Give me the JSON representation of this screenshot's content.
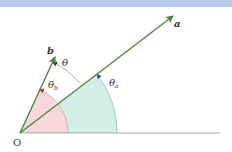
{
  "diagram": {
    "title": "",
    "header_band_color": "#b9c9e6",
    "origin": {
      "label": "O",
      "x": 20,
      "y": 133
    },
    "baseline": {
      "x1": 20,
      "y1": 133,
      "x2": 220,
      "y2": 133,
      "color": "#aaaaaa"
    },
    "vectors": [
      {
        "name": "a",
        "label": "a",
        "x2": 173,
        "y2": 16,
        "color": "#4a8a3a"
      },
      {
        "name": "b",
        "label": "b",
        "x2": 55,
        "y2": 57,
        "color": "#4a8a3a"
      }
    ],
    "angles": [
      {
        "name": "theta",
        "label": "θ",
        "sub": "",
        "between": [
          "a",
          "b"
        ],
        "arrow_color": "#222222"
      },
      {
        "name": "theta_b",
        "label": "θ",
        "sub": "b",
        "between": [
          "x-axis",
          "b"
        ],
        "fill": "#f6d8dc",
        "arrow_color": "#d03020"
      },
      {
        "name": "theta_a",
        "label": "θ",
        "sub": "a",
        "between": [
          "x-axis",
          "a"
        ],
        "fill": "#d3eee6",
        "arrow_color": "#2050a0"
      }
    ],
    "labels": {
      "a": "a",
      "b": "b",
      "theta": "θ",
      "theta_b": "θ",
      "theta_b_sub": "b",
      "theta_a": "θ",
      "theta_a_sub": "a",
      "origin": "O"
    }
  }
}
